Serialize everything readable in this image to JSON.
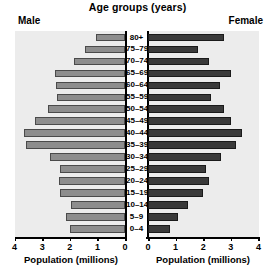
{
  "chart_data": {
    "type": "bar",
    "subtype": "population-pyramid",
    "title": "Age groups (years)",
    "left_label": "Male",
    "right_label": "Female",
    "xlabel": "Population (millions)",
    "ylabel": "Age groups (years)",
    "grid": false,
    "legend": "none",
    "categories": [
      "80+",
      "75–79",
      "70–74",
      "65–69",
      "60–64",
      "55–59",
      "50–54",
      "45–49",
      "40–44",
      "35–39",
      "30–34",
      "25–29",
      "20–24",
      "15–19",
      "10–14",
      "5–9",
      "0–4"
    ],
    "xlim_left": [
      4,
      0
    ],
    "xlim_right": [
      0,
      4
    ],
    "left_ticks": [
      "4",
      "3",
      "2",
      "1",
      "0"
    ],
    "right_ticks": [
      "0",
      "1",
      "2",
      "3",
      "4"
    ],
    "series": [
      {
        "name": "Male",
        "side": "left",
        "color": "#8d8d8d",
        "values": [
          1.05,
          1.45,
          1.85,
          2.55,
          2.5,
          2.45,
          2.8,
          3.25,
          3.65,
          3.6,
          2.7,
          2.35,
          2.4,
          2.35,
          1.95,
          2.15,
          2.0
        ]
      },
      {
        "name": "Female",
        "side": "right",
        "color": "#3a3a3a",
        "values": [
          2.75,
          1.8,
          2.2,
          3.0,
          2.6,
          2.3,
          2.75,
          3.0,
          3.4,
          3.2,
          2.65,
          2.1,
          2.2,
          2.0,
          1.45,
          1.1,
          0.8
        ]
      }
    ]
  }
}
